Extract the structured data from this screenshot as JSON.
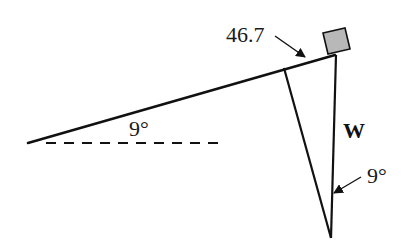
{
  "diagram": {
    "type": "inclined-plane-force-diagram",
    "labels": {
      "incline_length": "46.7",
      "incline_angle": "9°",
      "weight": "W",
      "weight_angle": "9°"
    },
    "colors": {
      "stroke": "#111111",
      "block_fill": "#b8b8b8",
      "background": "#ffffff"
    },
    "elements": [
      "inclined plane line at 9° above horizontal",
      "dashed horizontal reference line",
      "block (square) resting on top of incline",
      "weight vector W pointing straight down",
      "normal-component line perpendicular to incline",
      "angle marker 9° between W and perpendicular"
    ]
  }
}
